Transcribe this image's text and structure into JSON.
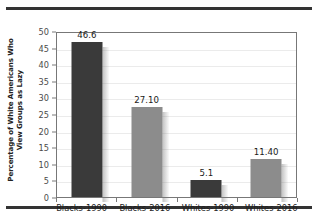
{
  "chart_data": {
    "type": "bar",
    "title": "",
    "xlabel": "",
    "ylabel_lines": [
      "Percentage of White Americans Who",
      "View Groups as Lazy"
    ],
    "ylabel": "Percentage of White Americans Who View Groups as Lazy",
    "categories": [
      "Blacks-1990",
      "Blacks-2016",
      "Whites-1990",
      "Whites-2016"
    ],
    "values": [
      46.6,
      27.1,
      5.1,
      11.4
    ],
    "value_labels": [
      "46.6",
      "27.10",
      "5.1",
      "11.40"
    ],
    "bar_colors": [
      "#3a3a3a",
      "#8c8c8c",
      "#3a3a3a",
      "#8c8c8c"
    ],
    "bar_styles": [
      "dark",
      "light",
      "dark",
      "light"
    ],
    "ylim": [
      0,
      50
    ],
    "ytick_step": 5,
    "ytick_labels": [
      "50",
      "45",
      "40",
      "35",
      "30",
      "25",
      "20",
      "15",
      "10",
      "5",
      "0"
    ],
    "ytick_values": [
      50,
      45,
      40,
      35,
      30,
      25,
      20,
      15,
      10,
      5,
      0
    ],
    "grid": true,
    "legend": false,
    "legend_position": "none"
  },
  "decor": {
    "rule_color": "#333333",
    "frame_color": "#777777",
    "gridline_color": "#ebebeb",
    "background": "#ffffff"
  }
}
